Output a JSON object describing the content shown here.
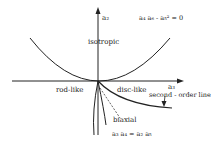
{
  "diagram": {
    "axes": {
      "vertical_label": "a₂",
      "horizontal_label": "a₃"
    },
    "regions": {
      "isotropic": "isotropic",
      "rod_like": "rod-like",
      "disc_like": "disc-like",
      "biaxial": "biaxial"
    },
    "curves": {
      "second_order_line": "second - order line",
      "top_condition": "a₄ a₆ - a₅² = 0",
      "bottom_condition": "a₃ a₄ = a₂ a₅"
    },
    "colors": {
      "line": "#222222",
      "background": "#ffffff"
    }
  }
}
